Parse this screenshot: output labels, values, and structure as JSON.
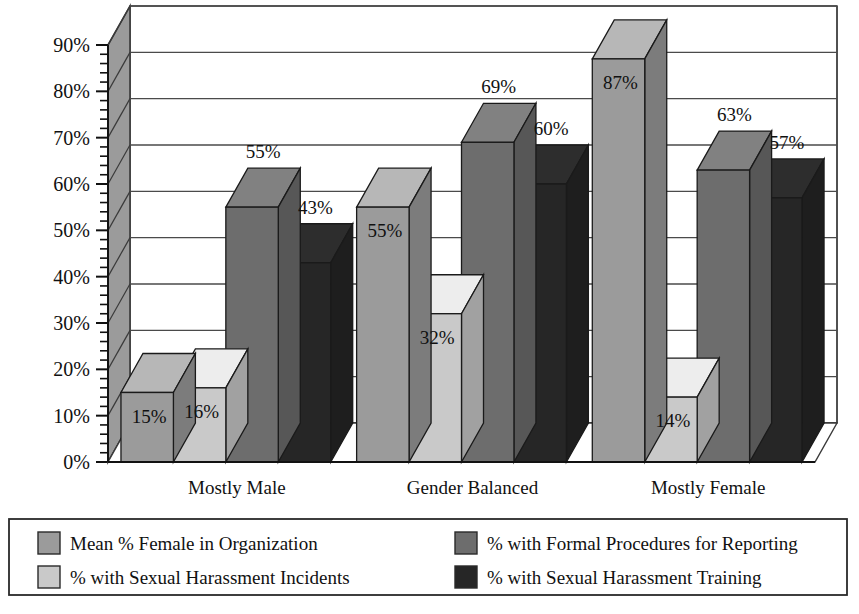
{
  "chart_data": {
    "type": "bar",
    "title": "",
    "subtitle": "",
    "xlabel": "",
    "ylabel": "",
    "categories": [
      "Mostly Male",
      "Gender Balanced",
      "Mostly Female"
    ],
    "ylim": [
      0,
      90
    ],
    "ytick_step": 10,
    "yticks": [
      "0%",
      "10%",
      "20%",
      "30%",
      "40%",
      "50%",
      "60%",
      "70%",
      "80%",
      "90%"
    ],
    "minor_ticks": true,
    "grid": true,
    "legend_position": "bottom",
    "three_d": true,
    "series": [
      {
        "name": "Mean % Female in Organization",
        "color": "#9b9b9b",
        "values": [
          15,
          55,
          87
        ],
        "labels": [
          "15%",
          "55%",
          "87%"
        ]
      },
      {
        "name": "% with Sexual Harassment Incidents",
        "color": "#c9c9c9",
        "values": [
          16,
          32,
          14
        ],
        "labels": [
          "16%",
          "32%",
          "14%"
        ]
      },
      {
        "name": "% with Formal Procedures for Reporting",
        "color": "#6d6d6d",
        "values": [
          55,
          69,
          63
        ],
        "labels": [
          "55%",
          "69%",
          "63%"
        ]
      },
      {
        "name": "% with Sexual Harassment Training",
        "color": "#262626",
        "values": [
          43,
          60,
          57
        ],
        "labels": [
          "43%",
          "60%",
          "57%"
        ]
      }
    ]
  },
  "axis": {
    "y_ticks": [
      "90%",
      "80%",
      "70%",
      "60%",
      "50%",
      "40%",
      "30%",
      "20%",
      "10%",
      "0%"
    ]
  },
  "categories": {
    "items": [
      {
        "label": "Mostly Male"
      },
      {
        "label": "Gender Balanced"
      },
      {
        "label": "Mostly Female"
      }
    ]
  },
  "legend": {
    "entries": [
      {
        "label": "Mean % Female in Organization",
        "color": "#9b9b9b"
      },
      {
        "label": "% with Sexual Harassment Incidents",
        "color": "#c9c9c9"
      },
      {
        "label": "% with Formal Procedures for Reporting",
        "color": "#6d6d6d"
      },
      {
        "label": "% with Sexual Harassment Training",
        "color": "#262626"
      }
    ]
  },
  "data_labels": {
    "g0": [
      "15%",
      "16%",
      "55%",
      "43%"
    ],
    "g1": [
      "55%",
      "32%",
      "69%",
      "60%"
    ],
    "g2": [
      "87%",
      "14%",
      "63%",
      "57%"
    ]
  }
}
